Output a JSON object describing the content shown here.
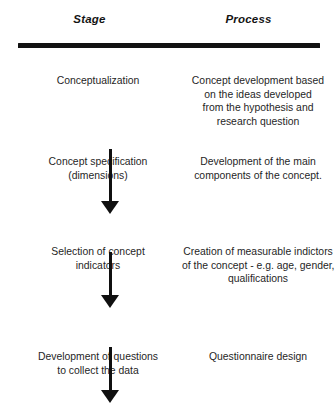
{
  "figure": {
    "columns": [
      {
        "id": "stage",
        "header": "Stage"
      },
      {
        "id": "process",
        "header": "Process"
      }
    ],
    "rows": [
      {
        "stage": [
          "Conceptualization"
        ],
        "process": [
          "Concept development based",
          "on the ideas developed",
          "from the hypothesis and",
          "research question"
        ]
      },
      {
        "stage": [
          "Concept specification",
          "(dimensions)"
        ],
        "process": [
          "Development of the main",
          "components of the concept."
        ]
      },
      {
        "stage": [
          "Selection of concept",
          "indicators"
        ],
        "process": [
          "Creation of measurable indictors",
          "of the concept - e.g. age, gender,",
          "qualifications"
        ]
      },
      {
        "stage": [
          "Development of questions",
          "to collect the data"
        ],
        "process": [
          "Questionnaire design"
        ]
      }
    ],
    "arrows": [
      {
        "name": "arrow-conceptualization-to-specification",
        "direction": "down"
      },
      {
        "name": "arrow-specification-to-indicators",
        "direction": "down"
      },
      {
        "name": "arrow-indicators-to-questions",
        "direction": "down"
      }
    ],
    "colors": {
      "ink": "#101010",
      "text": "#1f1f1f",
      "background": "#ffffff"
    }
  }
}
